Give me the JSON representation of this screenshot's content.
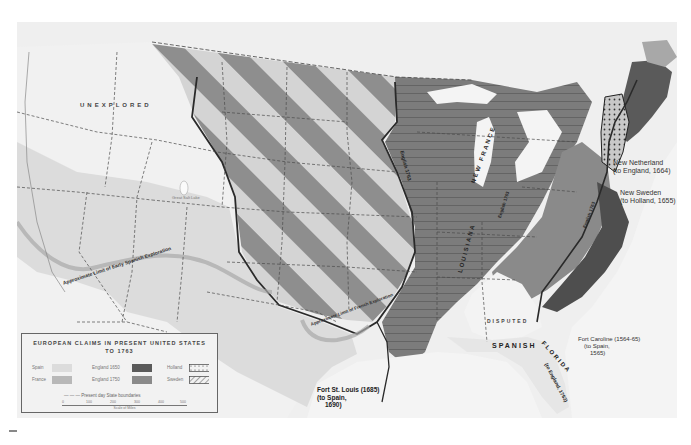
{
  "map": {
    "title": "EUROPEAN CLAIMS IN PRESENT UNITED STATES",
    "subtitle": "TO 1763",
    "region_labels": {
      "unexplored": "UNEXPLORED",
      "great_salt_lake": "Great Salt Lake",
      "early_spanish_limit": "Approximate Limit of Early Spanish Exploration",
      "french_limit": "Approximate Limit of French Exploration",
      "english_1763": "English 1763",
      "new_france": "NEW FRANCE",
      "louisiana": "LOUISIANA",
      "english_1763_south": "English 1763",
      "english_1763_east": "English 1763",
      "disputed": "DISPUTED",
      "spanish": "SPANISH",
      "florida": "FLORIDA",
      "florida_note": "(to England, 1763)"
    },
    "callouts": {
      "new_netherland": {
        "name": "New Netherland",
        "note": "(to England, 1664)"
      },
      "new_sweden": {
        "name": "New Sweden",
        "note": "(to Holland, 1655)"
      },
      "fort_caroline": {
        "name": "Fort Caroline (1564-65)",
        "note": "(to Spain,",
        "year": "1565)"
      },
      "fort_st_louis": {
        "name": "Fort St. Louis (1685)",
        "note": "(to Spain,",
        "year": "1690)"
      }
    },
    "colors": {
      "background": "#efefef",
      "spain": "#dcdcdc",
      "france": "#b8b8b8",
      "england_1650": "#5a5a5a",
      "england_1750": "#8a8a8a",
      "unexplored": "#f1f1f1",
      "stripe_light": "#d4d4d4",
      "stripe_dark": "#8e8e8e",
      "water": "#f4f4f4",
      "outline": "#2a2a2a"
    }
  },
  "legend": {
    "title": "EUROPEAN CLAIMS IN PRESENT UNITED STATES",
    "subtitle": "TO 1763",
    "items": [
      {
        "label": "Spain",
        "color": "#dcdcdc",
        "pattern": "solid"
      },
      {
        "label": "France",
        "color": "#b8b8b8",
        "pattern": "solid"
      },
      {
        "label": "England 1650",
        "color": "#5a5a5a",
        "pattern": "solid"
      },
      {
        "label": "England 1750",
        "color": "#8a8a8a",
        "pattern": "solid"
      },
      {
        "label": "Holland",
        "color": "#f2f2f2",
        "pattern": "dotted"
      },
      {
        "label": "Sweden",
        "color": "#f2f2f2",
        "pattern": "hatched"
      }
    ],
    "boundaries_label": "— — — Present day State boundaries",
    "scale": {
      "ticks": [
        "0",
        "100",
        "200",
        "300",
        "400",
        "500"
      ],
      "label": "Scale of Miles"
    }
  }
}
